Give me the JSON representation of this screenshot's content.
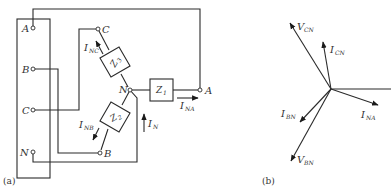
{
  "figure": {
    "panel_a": {
      "caption": "(a)",
      "source_terminals": [
        {
          "label": "A"
        },
        {
          "label": "B"
        },
        {
          "label": "C"
        },
        {
          "label": "N"
        }
      ],
      "load_terminals": {
        "C": "C",
        "B": "B",
        "A": "A",
        "N": "N"
      },
      "impedances": {
        "z1": {
          "main": "Z",
          "sub": "1"
        },
        "z2": {
          "main": "Z",
          "sub": "2"
        },
        "z3": {
          "main": "Z",
          "sub": "3"
        }
      },
      "currents": {
        "i_nc": {
          "main": "I",
          "sub": "NC"
        },
        "i_nb": {
          "main": "I",
          "sub": "NB"
        },
        "i_na": {
          "main": "I",
          "sub": "NA"
        },
        "i_n": {
          "main": "I",
          "sub": "N"
        }
      }
    },
    "panel_b": {
      "caption": "(b)",
      "phasors": {
        "v_cn": {
          "main": "V",
          "sub": "CN"
        },
        "i_cn": {
          "main": "I",
          "sub": "CN"
        },
        "i_na": {
          "main": "I",
          "sub": "NA"
        },
        "i_bn": {
          "main": "I",
          "sub": "BN"
        },
        "v_bn": {
          "main": "V",
          "sub": "BN"
        }
      }
    }
  }
}
